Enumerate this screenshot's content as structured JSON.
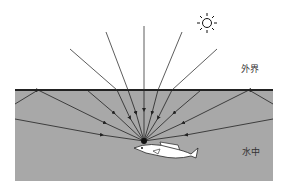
{
  "diagram": {
    "labels": {
      "outside": "外界",
      "underwater": "水中"
    },
    "colors": {
      "water": "#a8a8a8",
      "surface": "#222222",
      "ray": "#333333",
      "fish": "#ffffff"
    },
    "elements": [
      "sun-icon",
      "water-surface",
      "light-rays",
      "fish"
    ]
  }
}
